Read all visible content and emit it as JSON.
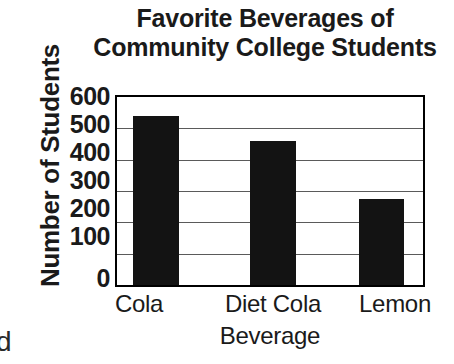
{
  "chart_data": {
    "type": "bar",
    "title": "Favorite Beverages of Community College Students",
    "title_lines": [
      "Favorite Beverages of",
      "Community College Students"
    ],
    "xlabel": "Beverage",
    "ylabel": "Number of Students",
    "categories": [
      "Cola",
      "Diet Cola",
      "Lemon"
    ],
    "values": [
      540,
      460,
      275
    ],
    "ylim": [
      0,
      600
    ],
    "yticks": [
      0,
      100,
      200,
      300,
      400,
      500,
      600
    ],
    "ytick_labels": [
      "0",
      "100",
      "200",
      "300",
      "400",
      "500",
      "600"
    ],
    "grid": true,
    "legend": false,
    "bar_color": "#131313",
    "axis_color": "#000000",
    "grid_color": "#5a5a5a",
    "background": "#ffffff"
  },
  "page_fragment": "d"
}
